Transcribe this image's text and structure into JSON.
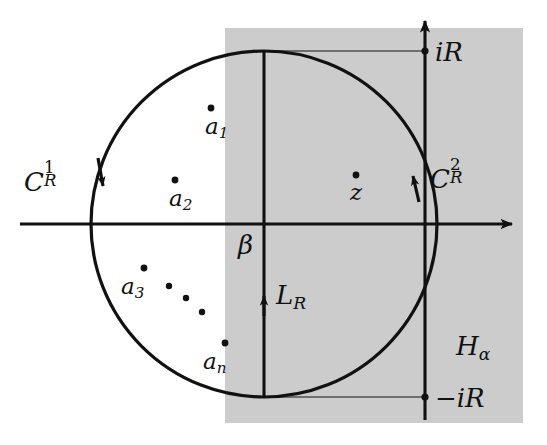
{
  "figure": {
    "type": "complex-plane-contour-diagram",
    "width": 547,
    "height": 445,
    "background_color": "#ffffff",
    "ink_color": "#111111",
    "shade_color": "#cccccc"
  },
  "axes": {
    "real_axis": {
      "name": "real-axis",
      "y": 224,
      "x_start": 20,
      "x_end": 522,
      "arrow": "right"
    },
    "imaginary_axis": {
      "name": "imaginary-axis",
      "x": 425,
      "y_start": 10,
      "y_end": 420,
      "arrow": "up"
    }
  },
  "half_plane": {
    "label": "H",
    "subscript": "α",
    "label_x": 456,
    "label_y": 333,
    "left": 225,
    "top": 28,
    "right": 523,
    "bottom": 423,
    "fill": "#cccccc"
  },
  "circle": {
    "center_x": 264,
    "center_y": 224,
    "radius": 173
  },
  "contours": [
    {
      "id": "left-arc",
      "label": "C",
      "superscript": "1",
      "subscript": "R",
      "label_x": 24,
      "label_y": 165,
      "direction": "clockwise-downward",
      "arrow_x": 102,
      "arrow_y": 176
    },
    {
      "id": "right-arc",
      "label": "C",
      "superscript": "2",
      "subscript": "R",
      "label_x": 430,
      "label_y": 162,
      "direction": "counterclockwise-upward",
      "arrow_x": 414,
      "arrow_y": 181
    }
  ],
  "vertical_segment": {
    "label": "L",
    "subscript": "R",
    "label_x": 276,
    "label_y": 282,
    "x": 264,
    "y_top": 51,
    "y_bottom": 397,
    "arrow_y": 296,
    "arrow": "up"
  },
  "beta_label": {
    "text": "β",
    "x": 238,
    "y": 232
  },
  "markers": [
    {
      "name": "point-iR",
      "label": "iR",
      "dot_x": 425,
      "dot_y": 51,
      "label_x": 435,
      "label_y": 39,
      "connector_from_x": 264,
      "connector_to_x": 425,
      "connector_y": 51
    },
    {
      "name": "point-minus-iR",
      "label": "−iR",
      "dot_x": 425,
      "dot_y": 397,
      "label_x": 435,
      "label_y": 385,
      "connector_from_x": 264,
      "connector_to_x": 425,
      "connector_y": 397
    }
  ],
  "poles": [
    {
      "name": "pole-a1",
      "label": "a",
      "subscript": "1",
      "dot_x": 211,
      "dot_y": 108,
      "label_x": 205,
      "label_y": 115
    },
    {
      "name": "pole-a2",
      "label": "a",
      "subscript": "2",
      "dot_x": 175,
      "dot_y": 180,
      "label_x": 169,
      "label_y": 187
    },
    {
      "name": "pole-a3",
      "label": "a",
      "subscript": "3",
      "dot_x": 144,
      "dot_y": 268,
      "label_x": 121,
      "label_y": 275
    },
    {
      "name": "pole-an",
      "label": "a",
      "subscript": "n",
      "dot_x": 225,
      "dot_y": 343,
      "label_x": 203,
      "label_y": 350
    }
  ],
  "ellipsis_dots": [
    {
      "x": 169,
      "y": 286
    },
    {
      "x": 186,
      "y": 298
    },
    {
      "x": 202,
      "y": 312
    }
  ],
  "z_point": {
    "name": "point-z",
    "label": "z",
    "dot_x": 356,
    "dot_y": 175,
    "label_x": 350,
    "label_y": 181
  }
}
